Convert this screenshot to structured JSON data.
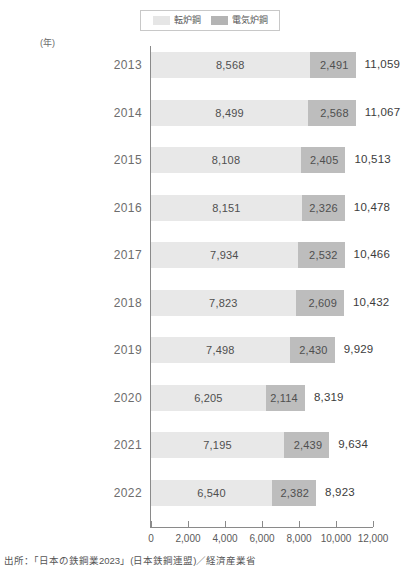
{
  "legend": {
    "items": [
      {
        "label": "転炉鋼",
        "color": "#e8e8e8",
        "key": "converter"
      },
      {
        "label": "電気炉鋼",
        "color": "#bdbdbd",
        "key": "electric"
      }
    ]
  },
  "axis": {
    "unit_label": "(年)",
    "x_ticks": [
      "0",
      "2,000",
      "4,000",
      "6,000",
      "8,000",
      "10,000",
      "12,000"
    ]
  },
  "footnote": {
    "text": "出所：「日本の鉄鋼業2023」(日本鉄鋼連盟)／経済産業省"
  },
  "chart_data": {
    "type": "bar",
    "orientation": "horizontal",
    "stacked": true,
    "title": "",
    "xlabel": "",
    "ylabel": "(年)",
    "xlim": [
      0,
      12000
    ],
    "xticks": [
      0,
      2000,
      4000,
      6000,
      8000,
      10000,
      12000
    ],
    "grid": false,
    "legend_position": "top-center",
    "categories": [
      "2013",
      "2014",
      "2015",
      "2016",
      "2017",
      "2018",
      "2019",
      "2020",
      "2021",
      "2022"
    ],
    "series": [
      {
        "name": "転炉鋼",
        "color": "#e8e8e8",
        "values": [
          8568,
          8499,
          8108,
          8151,
          7934,
          7823,
          7498,
          6205,
          7195,
          6540
        ],
        "labels": [
          "8,568",
          "8,499",
          "8,108",
          "8,151",
          "7,934",
          "7,823",
          "7,498",
          "6,205",
          "7,195",
          "6,540"
        ]
      },
      {
        "name": "電気炉鋼",
        "color": "#bdbdbd",
        "values": [
          2491,
          2568,
          2405,
          2326,
          2532,
          2609,
          2430,
          2114,
          2439,
          2382
        ],
        "labels": [
          "2,491",
          "2,568",
          "2,405",
          "2,326",
          "2,532",
          "2,609",
          "2,430",
          "2,114",
          "2,439",
          "2,382"
        ]
      }
    ],
    "totals": [
      11059,
      11067,
      10513,
      10478,
      10466,
      10432,
      9929,
      8319,
      9634,
      8923
    ],
    "total_labels": [
      "11,059",
      "11,067",
      "10,513",
      "10,478",
      "10,466",
      "10,432",
      "9,929",
      "8,319",
      "9,634",
      "8,923"
    ]
  }
}
